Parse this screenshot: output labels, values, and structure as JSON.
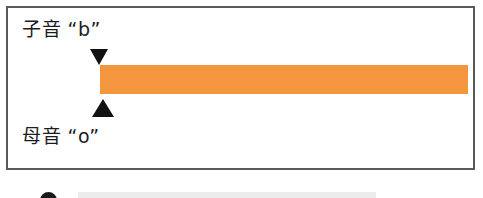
{
  "figure": {
    "panel": {
      "border_color": "#5a5a5c",
      "background_color": "#ffffff"
    },
    "labels": {
      "consonant": "子音 “b”",
      "vowel": "母音 “o”"
    },
    "markers": {
      "consonant_marker": "down-triangle-marker",
      "vowel_marker": "up-triangle-marker",
      "marker_color": "#111111"
    },
    "duration_bar": {
      "name": "orange-duration-bar",
      "color": "#f4963e"
    },
    "next_row": {
      "bullet": "bullet-marker",
      "bullet_color": "#1a1a1a",
      "bar_color": "#ececec"
    }
  }
}
